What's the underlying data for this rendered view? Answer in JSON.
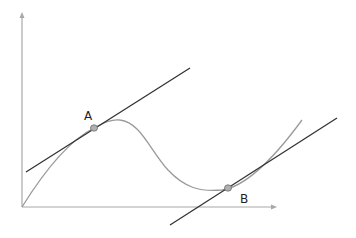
{
  "diagram": {
    "type": "function-curve-with-tangent-lines",
    "axes": {
      "origin": [
        22,
        207
      ],
      "y_axis_top": [
        22,
        14
      ],
      "x_axis_right": [
        275,
        207
      ],
      "color": "#a8a8a8"
    },
    "curve": {
      "color": "#9a9a9a",
      "description": "Curve rising from origin to local maximum, descending to a local minimum, then rising again"
    },
    "points": [
      {
        "label": "A",
        "x": 94,
        "y": 128,
        "label_x": 84,
        "label_y": 120
      },
      {
        "label": "B",
        "x": 228,
        "y": 188,
        "label_x": 240,
        "label_y": 203
      }
    ],
    "tangents": [
      {
        "name": "tangent-at-A",
        "from": [
          26,
          172
        ],
        "to": [
          190,
          68
        ],
        "color": "#333333"
      },
      {
        "name": "tangent-at-B",
        "from": [
          170,
          225
        ],
        "to": [
          337,
          118
        ],
        "color": "#333333"
      }
    ],
    "point_marker": {
      "fill": "#b0b0b0",
      "stroke": "#707070",
      "radius": 3.5
    }
  }
}
